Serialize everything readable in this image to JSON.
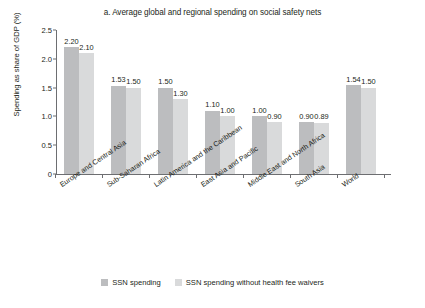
{
  "chart_data": {
    "type": "bar",
    "title": "a. Average global and regional spending on social safety nets",
    "xlabel": "",
    "ylabel": "Spending as share of GDP (%)",
    "ylim": [
      0,
      2.5
    ],
    "yticks": [
      "0",
      "0.5",
      "1.0",
      "1.5",
      "2.0",
      "2.5"
    ],
    "ytick_values": [
      0,
      0.5,
      1.0,
      1.5,
      2.0,
      2.5
    ],
    "grid": false,
    "legend_position": "bottom",
    "categories": [
      "Europe and Central Asia",
      "Sub-Saharan Africa",
      "Latin America and the Caribbean",
      "East Asia and Pacific",
      "Middle East and North Africa",
      "South Asia",
      "World"
    ],
    "series": [
      {
        "name": "SSN spending",
        "color": "#bcbdbf",
        "values": [
          2.2,
          1.53,
          1.5,
          1.1,
          1.0,
          0.9,
          1.54
        ],
        "labels": [
          "2.20",
          "1.53",
          "1.50",
          "1.10",
          "1.00",
          "0.90",
          "1.54"
        ]
      },
      {
        "name": "SSN spending without health fee waivers",
        "color": "#d9dadb",
        "values": [
          2.1,
          1.5,
          1.3,
          1.0,
          0.9,
          0.89,
          1.5
        ],
        "labels": [
          "2.10",
          "1.50",
          "1.30",
          "1.00",
          "0.90",
          "0.89",
          "1.50"
        ]
      }
    ]
  },
  "colors": {
    "series1": "#bcbdbf",
    "series2": "#d9dadb",
    "axis": "#6d6e71",
    "text": "#231f20",
    "background": "#ffffff"
  }
}
